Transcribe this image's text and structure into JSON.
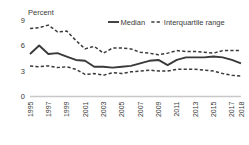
{
  "chart_data": {
    "type": "line",
    "title": "",
    "ylabel": "Percent",
    "xlabel": "",
    "ylim": [
      0,
      9
    ],
    "yticks": [
      0,
      3,
      6,
      9
    ],
    "ytick_labels": [
      "0",
      "3",
      "6",
      "9"
    ],
    "grid": false,
    "legend_position": "top-center",
    "x": [
      1995,
      1996,
      1997,
      1998,
      1999,
      2000,
      2001,
      2002,
      2003,
      2004,
      2005,
      2006,
      2007,
      2008,
      2009,
      2010,
      2011,
      2012,
      2013,
      2014,
      2015,
      2016,
      2017,
      2018
    ],
    "xtick_labels": [
      "1995",
      "",
      "1997",
      "",
      "1999",
      "",
      "2001",
      "",
      "2003",
      "",
      "2005",
      "",
      "2007",
      "",
      "2009",
      "",
      "2011",
      "",
      "2013",
      "",
      "2015",
      "",
      "2017",
      "2018"
    ],
    "series": [
      {
        "name": "Interquartile range",
        "role": "upper-quartile",
        "style": "dashed",
        "color": "#3a3a3a",
        "values": [
          8.0,
          8.1,
          8.4,
          7.6,
          7.7,
          6.6,
          5.6,
          5.9,
          5.1,
          5.7,
          5.7,
          5.6,
          5.2,
          5.1,
          4.9,
          5.1,
          5.4,
          5.3,
          5.3,
          5.2,
          5.1,
          5.4,
          5.4,
          5.4
        ]
      },
      {
        "name": "Median",
        "role": "median",
        "style": "solid",
        "color": "#3a3a3a",
        "values": [
          5.0,
          6.0,
          5.0,
          5.1,
          4.7,
          4.3,
          4.2,
          3.5,
          3.5,
          3.4,
          3.5,
          3.6,
          3.9,
          4.2,
          4.3,
          3.7,
          4.3,
          4.6,
          4.6,
          4.6,
          4.7,
          4.6,
          4.3,
          3.9
        ]
      },
      {
        "name": "Interquartile range",
        "role": "lower-quartile",
        "style": "dashed",
        "color": "#3a3a3a",
        "values": [
          3.6,
          3.5,
          3.6,
          3.4,
          3.5,
          3.2,
          2.6,
          2.7,
          2.5,
          2.8,
          2.7,
          2.9,
          3.0,
          3.1,
          3.0,
          3.0,
          3.2,
          3.2,
          3.2,
          3.1,
          3.0,
          2.7,
          2.5,
          2.4
        ]
      }
    ],
    "legend": [
      {
        "label": "Median",
        "style": "solid"
      },
      {
        "label": "Interquartile range",
        "style": "dashed"
      }
    ]
  },
  "colors": {
    "line": "#3a3a3a",
    "axis": "#c8c8c8",
    "text": "#3a3a3a",
    "background": "#ffffff"
  }
}
